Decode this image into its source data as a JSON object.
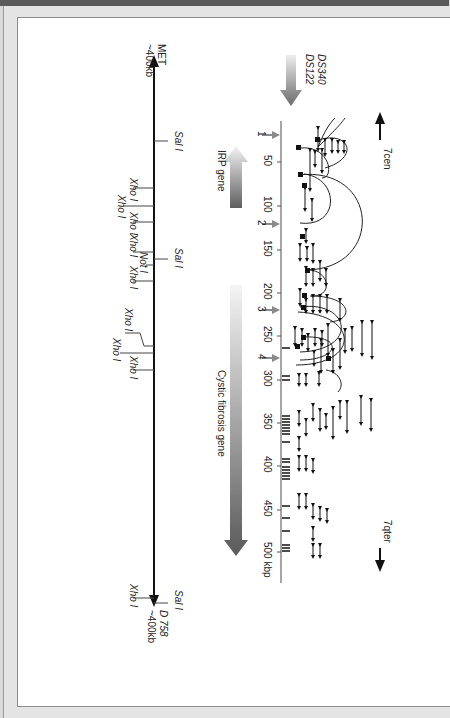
{
  "figure": {
    "header_text": "",
    "orientation": "rotated 90° clockwise",
    "probes": [
      "DS340",
      "DS122"
    ],
    "left_end": {
      "label": "MET",
      "distance": "~400kb"
    },
    "right_end": {
      "label": "D 758",
      "distance": "~400kb"
    },
    "centromere_label": "7cen",
    "telomere_label": "7qter",
    "scale": {
      "unit": "kbp",
      "ticks": [
        "50",
        "100",
        "150",
        "200",
        "250",
        "300",
        "350",
        "400",
        "450",
        "500 kbp"
      ]
    },
    "markers": [
      "1",
      "2",
      "3",
      "4"
    ],
    "genes": [
      {
        "name": "IRP gene"
      },
      {
        "name": "Cystic fibrosis gene"
      }
    ],
    "restriction_sites": {
      "sal1": "Sal I",
      "xho1": "Xho I",
      "not1": "Not I"
    },
    "colors": {
      "gene_arrow_dark": "#5e5e5e",
      "gene_arrow_light": "#f2f2f2",
      "marker_arrow": "#8a8a8a",
      "line": "#111111",
      "frame_bg": "#e4e4e4",
      "topbar": "#5a5a5a"
    }
  }
}
